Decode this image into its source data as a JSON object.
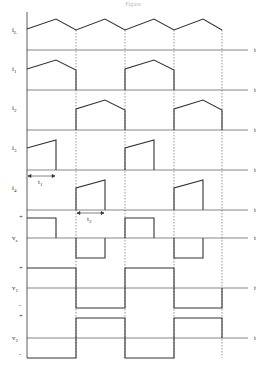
{
  "title": "Figure",
  "axis_label": "t",
  "colors": {
    "line": "#333333",
    "dashed": "#555555",
    "background": "#ffffff"
  },
  "x_axis": {
    "left": 27,
    "right": 248,
    "switch_points": [
      76,
      125,
      174,
      222
    ]
  },
  "plots": [
    {
      "id": "iL",
      "label": "i",
      "sub": "L",
      "axis_y": 50
    },
    {
      "id": "i1",
      "label": "i",
      "sub": "1",
      "axis_y": 90
    },
    {
      "id": "i2",
      "label": "i",
      "sub": "2",
      "axis_y": 130
    },
    {
      "id": "i3",
      "label": "i",
      "sub": "3",
      "axis_y": 170,
      "interval_label": "t1"
    },
    {
      "id": "i4",
      "label": "i",
      "sub": "4",
      "axis_y": 210,
      "interval_label": "t2"
    },
    {
      "id": "vs",
      "label": "v",
      "sub": "s",
      "axis_y": 238,
      "plus": "+",
      "minus": "-"
    },
    {
      "id": "v1",
      "label": "v",
      "sub": "1",
      "axis_y": 288,
      "plus": "+",
      "minus": "-"
    },
    {
      "id": "v2",
      "label": "v",
      "sub": "2",
      "axis_y": 338,
      "plus": "+",
      "minus": "-"
    }
  ],
  "intervals": {
    "t1": "t",
    "t1_sub": "1",
    "t2": "t",
    "t2_sub": "2"
  }
}
